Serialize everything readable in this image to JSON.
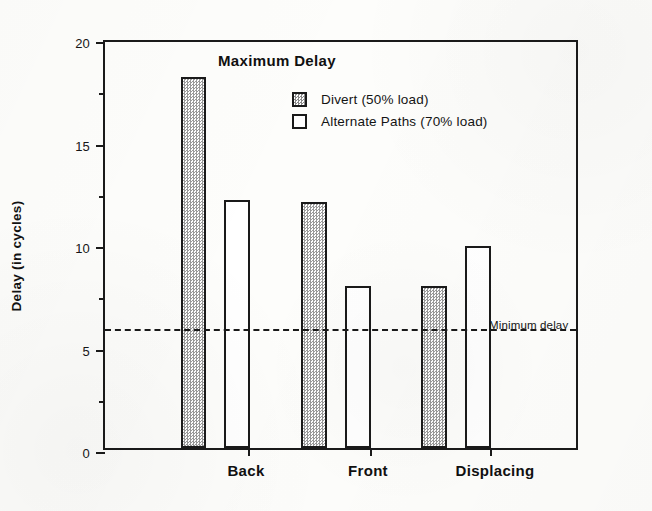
{
  "chart_data": {
    "type": "bar",
    "title": "Maximum Delay",
    "xlabel": "",
    "ylabel": "Delay (in cycles)",
    "categories": [
      "Back",
      "Front",
      "Displacing"
    ],
    "series": [
      {
        "name": "Divert (50% load)",
        "values": [
          18.1,
          12.0,
          7.9
        ]
      },
      {
        "name": "Alternate Paths (70% load)",
        "values": [
          12.1,
          7.9,
          9.85
        ]
      }
    ],
    "ylim": [
      0,
      20
    ],
    "ytick_labels": [
      "0",
      "5",
      "10",
      "15",
      "20"
    ],
    "ytick_values": [
      0,
      5,
      10,
      15,
      20
    ],
    "yminor_values": [
      2.5,
      7.5,
      12.5,
      17.5
    ],
    "grid": false,
    "legend_position": "inside-top-right",
    "annotations": [
      {
        "name": "minimum-delay",
        "label": "Minimum delay",
        "value": 6,
        "style": "dashed-horizontal-line"
      }
    ],
    "colors": {
      "ink": "#1a1a1a",
      "paper": "#fdfdfb",
      "divert_fill": "#ffffff",
      "divert_pattern": "#9a9a9a",
      "alternate_fill": "#ffffff"
    }
  }
}
